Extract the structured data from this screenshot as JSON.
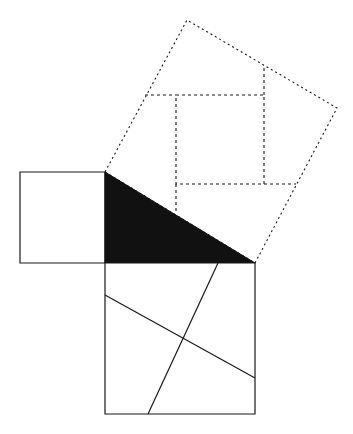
{
  "canvas": {
    "width": 353,
    "height": 434,
    "background": "#ffffff",
    "title": "Pythagorean theorem dissection figure"
  },
  "style": {
    "stroke_color": "#1a1a1a",
    "fill_black": "#111111",
    "fill_white": "#ffffff",
    "solid_stroke_width": 1.2,
    "dashed_stroke_width": 1.1,
    "dash_pattern": "3,3",
    "dot_pattern": "2,3"
  },
  "figure": {
    "name": "perigal-dissection",
    "triangle": {
      "name": "right-triangle",
      "fill": "#111111",
      "vertices": [
        {
          "label": "A",
          "x": 105,
          "y": 172
        },
        {
          "label": "B",
          "x": 105,
          "y": 263
        },
        {
          "label": "C",
          "x": 255,
          "y": 263
        }
      ],
      "right_angle_at": "B",
      "leg_vertical_length": 91,
      "leg_horizontal_length": 150,
      "hypotenuse_length": 175
    },
    "square_on_vertical_leg": {
      "name": "small-square-left",
      "fill": "#ffffff",
      "stroke_style": "solid",
      "corners": [
        {
          "x": 105,
          "y": 172
        },
        {
          "x": 20,
          "y": 172
        },
        {
          "x": 20,
          "y": 263
        },
        {
          "x": 105,
          "y": 263
        }
      ],
      "side_length": 85
    },
    "square_on_horizontal_leg": {
      "name": "large-square-bottom",
      "fill": "#ffffff",
      "stroke_style": "solid",
      "corners": [
        {
          "x": 105,
          "y": 263
        },
        {
          "x": 255,
          "y": 263
        },
        {
          "x": 255,
          "y": 414
        },
        {
          "x": 105,
          "y": 414
        }
      ],
      "side_length": 150,
      "dissection_lines": [
        {
          "name": "dissection-line-shallow",
          "from": {
            "x": 105,
            "y": 295
          },
          "to": {
            "x": 255,
            "y": 378
          }
        },
        {
          "name": "dissection-line-steep",
          "from": {
            "x": 218,
            "y": 263
          },
          "to": {
            "x": 148,
            "y": 414
          }
        }
      ]
    },
    "square_on_hypotenuse": {
      "name": "tilted-square-hypotenuse",
      "fill": "#ffffff",
      "stroke_style": "dotted",
      "corners": [
        {
          "x": 105,
          "y": 172
        },
        {
          "x": 187,
          "y": 20
        },
        {
          "x": 337,
          "y": 108
        },
        {
          "x": 255,
          "y": 263
        }
      ],
      "side_length": 173
    },
    "inner_dashed_square": {
      "name": "inner-dashed-square",
      "stroke_style": "dashed",
      "corners": [
        {
          "x": 176,
          "y": 95
        },
        {
          "x": 264,
          "y": 95
        },
        {
          "x": 264,
          "y": 184
        },
        {
          "x": 176,
          "y": 184
        }
      ],
      "side_length": 88
    },
    "dissection_rays": [
      {
        "name": "ray-top-left-horizontal",
        "from": {
          "x": 145,
          "y": 95
        },
        "to": {
          "x": 176,
          "y": 95
        }
      },
      {
        "name": "ray-top-right-vertical",
        "from": {
          "x": 264,
          "y": 68
        },
        "to": {
          "x": 264,
          "y": 95
        }
      },
      {
        "name": "ray-bottom-right-horizontal",
        "from": {
          "x": 264,
          "y": 184
        },
        "to": {
          "x": 296,
          "y": 184
        }
      },
      {
        "name": "ray-bottom-left-vertical",
        "from": {
          "x": 176,
          "y": 184
        },
        "to": {
          "x": 176,
          "y": 213
        }
      }
    ]
  }
}
